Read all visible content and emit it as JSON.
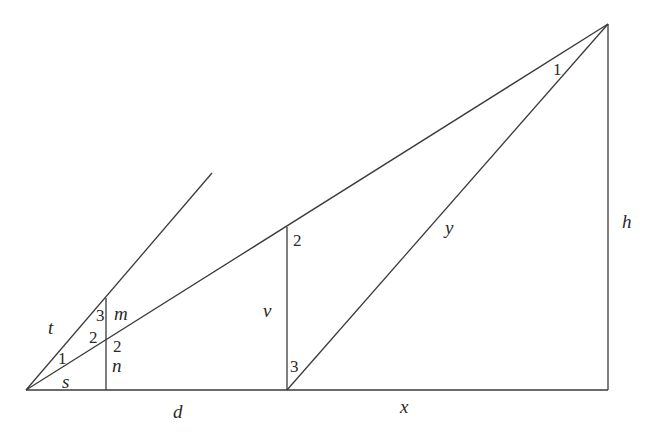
{
  "diagram": {
    "type": "geometry-similar-triangles",
    "points": {
      "origin": [
        26,
        390
      ],
      "foot_n": [
        106,
        390
      ],
      "foot_v": [
        287,
        390
      ],
      "foot_h": [
        608,
        390
      ],
      "apex": [
        608,
        24
      ],
      "top_v": [
        287,
        227
      ],
      "top_m": [
        106,
        298
      ],
      "mid_n": [
        106,
        344
      ],
      "ray_end": [
        212,
        173
      ]
    },
    "segments": [
      {
        "name": "baseline",
        "from": "origin",
        "to": "foot_h"
      },
      {
        "name": "height-h",
        "from": "foot_h",
        "to": "apex"
      },
      {
        "name": "hypotenuse-main",
        "from": "origin",
        "to": "apex"
      },
      {
        "name": "line-y",
        "from": "foot_v",
        "to": "apex"
      },
      {
        "name": "vertical-v",
        "from": "foot_v",
        "to": "top_v"
      },
      {
        "name": "vertical-mn",
        "from": "foot_n",
        "to": "top_m"
      },
      {
        "name": "ray-t",
        "from": "origin",
        "to": "ray_end"
      }
    ],
    "variable_labels": [
      {
        "id": "t",
        "text": "t",
        "x": 48,
        "y": 334
      },
      {
        "id": "m",
        "text": "m",
        "x": 114,
        "y": 320
      },
      {
        "id": "n",
        "text": "n",
        "x": 112,
        "y": 372
      },
      {
        "id": "s",
        "text": "s",
        "x": 62,
        "y": 388
      },
      {
        "id": "v",
        "text": "v",
        "x": 263,
        "y": 317
      },
      {
        "id": "d",
        "text": "d",
        "x": 173,
        "y": 418
      },
      {
        "id": "x",
        "text": "x",
        "x": 400,
        "y": 413
      },
      {
        "id": "y",
        "text": "y",
        "x": 445,
        "y": 234
      },
      {
        "id": "h",
        "text": "h",
        "x": 622,
        "y": 228
      }
    ],
    "angle_labels": [
      {
        "id": "angle-1-left",
        "text": "1",
        "x": 58,
        "y": 364
      },
      {
        "id": "angle-2-left-upper",
        "text": "2",
        "x": 89,
        "y": 343
      },
      {
        "id": "angle-3-left",
        "text": "3",
        "x": 96,
        "y": 321
      },
      {
        "id": "angle-2-left-lower",
        "text": "2",
        "x": 113,
        "y": 352
      },
      {
        "id": "angle-2-mid",
        "text": "2",
        "x": 293,
        "y": 246
      },
      {
        "id": "angle-3-mid",
        "text": "3",
        "x": 290,
        "y": 372
      },
      {
        "id": "angle-1-apex",
        "text": "1",
        "x": 553,
        "y": 75
      }
    ]
  }
}
